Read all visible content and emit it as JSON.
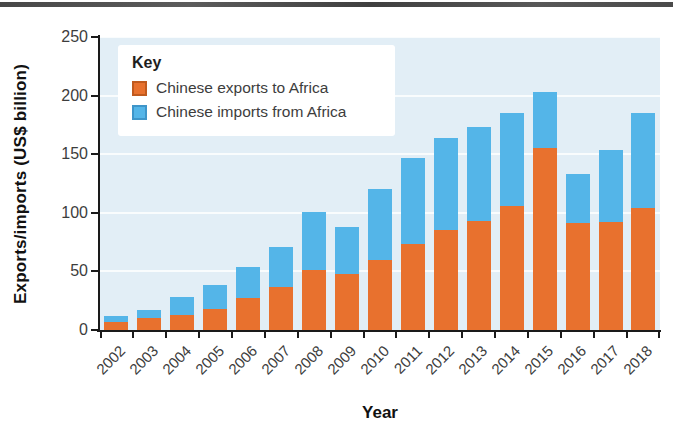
{
  "chart_data": {
    "type": "bar",
    "stacked": true,
    "title": "",
    "xlabel": "Year",
    "ylabel": "Exports/imports (US$ billion)",
    "ylim": [
      0,
      250
    ],
    "yticks": [
      0,
      50,
      100,
      150,
      200,
      250
    ],
    "grid": "horizontal-white-lines",
    "legend": {
      "title": "Key",
      "position": "top-left"
    },
    "categories": [
      "2002",
      "2003",
      "2004",
      "2005",
      "2006",
      "2007",
      "2008",
      "2009",
      "2010",
      "2011",
      "2012",
      "2013",
      "2014",
      "2015",
      "2016",
      "2017",
      "2018"
    ],
    "series": [
      {
        "name": "Chinese exports to Africa",
        "color": "#E8712E",
        "swatch_border": "#C05A1E",
        "values": [
          7,
          10,
          13,
          18,
          27,
          37,
          51,
          48,
          60,
          73,
          85,
          93,
          106,
          155,
          91,
          92,
          104
        ]
      },
      {
        "name": "Chinese imports from Africa",
        "color": "#54B5E8",
        "swatch_border": "#3E95C9",
        "values": [
          5,
          7,
          15,
          20,
          27,
          34,
          50,
          40,
          60,
          74,
          79,
          80,
          79,
          48,
          42,
          62,
          81
        ]
      }
    ]
  },
  "colors": {
    "plot_background": "#E2EEF6",
    "gridline": "#FFFFFF",
    "axis": "#1A1A1A",
    "tick_label": "#3D3D3D",
    "page_background": "#FFFFFF",
    "top_band": "#4E4E4E"
  }
}
